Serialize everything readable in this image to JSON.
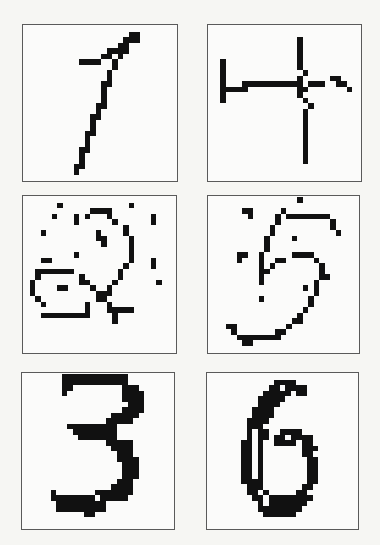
{
  "figure": {
    "panels": [
      {
        "label": "1",
        "rows": [
          "............................",
          "...................##.......",
          "..................###.......",
          ".................##.........",
          "...............####.........",
          "..............##.#..........",
          "..........####..#...........",
          "................#...........",
          "...............#............",
          "...............#............",
          "..............##............",
          "..............#.............",
          "..............#.............",
          "..............#.............",
          ".............##.............",
          ".............#..............",
          "............##..............",
          "............#...............",
          "............#...............",
          "...........##...............",
          "...........#................",
          "...........#................",
          "..........##................",
          "..........#.................",
          "..........#.................",
          ".........##.................",
          ".........#..................",
          "............................"
        ]
      },
      {
        "label": "4",
        "rows": [
          "............................",
          "............................",
          "................#...........",
          "................#...........",
          "................#...........",
          "................#...........",
          "..#.............#...........",
          "..#.............#...........",
          "..#..............#..........",
          "..#.............#.....##....",
          "..#...###########.###..##...",
          "..#####.........##.......#..",
          "..#.............#...........",
          "..#..............#..........",
          "..................#.........",
          ".................#..........",
          ".................#..........",
          ".................#..........",
          ".................#..........",
          ".................#..........",
          ".................#..........",
          ".................#..........",
          ".................#..........",
          ".................#..........",
          ".................#..........",
          "............................",
          "............................",
          "............................"
        ]
      },
      {
        "label": "2",
        "rows": [
          "............................",
          "......#............#........",
          "............####............",
          ".....#...#.#...#.......#....",
          ".........#......#......#....",
          "..................#.........",
          "...#.........#....#.........",
          ".............##....#........",
          "..............#....#........",
          "...................#........",
          ".........#.........#........",
          "...##..............#...#....",
          "..................#....#....",
          "..#######........#..........",
          "..#.......#......#..........",
          ".#........##....#.......#...",
          ".#....##....#..#............",
          ".#...........###............",
          "..#..........##.............",
          "...#.......#...#............",
          "...........#...#####........",
          "...#########....#...........",
          "................#...........",
          "............................",
          "............................",
          "............................",
          "............................",
          "............................"
        ]
      },
      {
        "label": "5",
        "rows": [
          "................#...........",
          "............................",
          "......##.....#..............",
          ".......#....#.########......",
          "............#.........#.....",
          "...........#..........#.....",
          "...........#...........#....",
          "..........#....#............",
          "..........#.................",
          "..........#.................",
          ".....##..#.....####.........",
          ".....#...#..##.....#........",
          ".........#.#........#.......",
          ".........##.........#.......",
          ".........#..........##......",
          ".........#.........#........",
          ".................#.#........",
          "...................#........",
          ".........#........#.........",
          "..................#.........",
          ".................#..........",
          "................#...........",
          "...............##...........",
          "...##.........#.............",
          "....#.......##..............",
          ".....########...............",
          "......##....................",
          "............................"
        ]
      },
      {
        "label": "3",
        "rows": [
          ".......############.........",
          ".......############.........",
          ".......##.........###.......",
          ".......#..........####......",
          "..................####......",
          "...................###......",
          "..................####......",
          "................#####.......",
          "...............#####........",
          "........#########...........",
          ".........########...........",
          "..........#######...........",
          "...............#####........",
          "................####........",
          ".................###........",
          ".................####.......",
          "..................###.......",
          "..................###.......",
          "..................###.......",
          ".................###........",
          "................####........",
          ".....#.......#######........",
          ".....########.#####.........",
          "......#########.............",
          "......#########.............",
          "...........##...............",
          "............................",
          "............................"
        ]
      },
      {
        "label": "6",
        "rows": [
          "............................",
          "............####............",
          "...........##.####..........",
          "..........#####.##..........",
          ".........#####..............",
          ".........####...............",
          "........####................",
          "........####................",
          ".......####.................",
          ".......###..................",
          ".......#.##..####...........",
          ".......#.##.##.####.........",
          "......##.#..####.##.........",
          "......##.#.......###........",
          "......##.#.......##.........",
          "......##.#........##........",
          "......##.#........##........",
          "......##.#........##........",
          "......##.#........##........",
          "......####........##........",
          ".......###.......##.........",
          ".......##.#.....##..........",
          "........##.########.........",
          ".........#.#######..........",
          ".........########...........",
          "..........######............",
          "............................",
          "............................"
        ]
      }
    ]
  },
  "colors": {
    "ink": "#111111",
    "border": "#5a5a5a",
    "background": "#f6f6f3"
  }
}
